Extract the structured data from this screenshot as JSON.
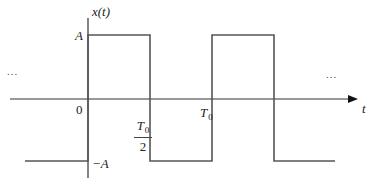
{
  "diagram": {
    "type": "square-wave-signal-plot",
    "colors": {
      "axis": "#333333",
      "waveform": "#555555",
      "text": "#222222"
    },
    "labels": {
      "y_axis": "x(t)",
      "x_axis": "t",
      "high_level": "A",
      "low_level": "−A",
      "origin": "0",
      "half_period_num": "T",
      "half_period_sub": "0",
      "half_period_den": "2",
      "period": "T",
      "period_sub": "0",
      "continuation_left": "...",
      "continuation_right": "..."
    },
    "waveform": {
      "levels": {
        "high": "A",
        "low": "−A"
      },
      "segments": [
        {
          "from": "-T0/2",
          "to": "0",
          "level": "−A"
        },
        {
          "from": "0",
          "to": "T0/2",
          "level": "A"
        },
        {
          "from": "T0/2",
          "to": "T0",
          "level": "−A"
        },
        {
          "from": "T0",
          "to": "3T0/2",
          "level": "A"
        },
        {
          "from": "3T0/2",
          "to": "2T0",
          "level": "−A"
        }
      ]
    }
  }
}
